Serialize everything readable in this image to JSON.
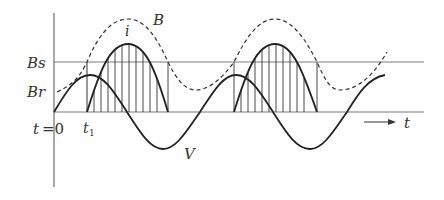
{
  "labels": {
    "bs": "Bs",
    "br": "Br",
    "t0_t": "t",
    "t0_eq": "=0",
    "t1_t": "t",
    "t1_sub": "1",
    "b_curve": "B",
    "i_curve": "i",
    "v_curve": "V",
    "time_axis": "t"
  },
  "colors": {
    "line": "#333333",
    "grid": "#7a7a7a",
    "background": "#ffffff"
  },
  "geometry": {
    "axis_x": 54,
    "axis_top": 13,
    "axis_bottom": 187,
    "baseline_y": 112,
    "bs_y": 62,
    "line_end_x": 424,
    "t1_x": 87,
    "lobe1": [
      87,
      168
    ],
    "lobe2": [
      234,
      317
    ],
    "v_period": 146,
    "v_amplitude": 37
  }
}
